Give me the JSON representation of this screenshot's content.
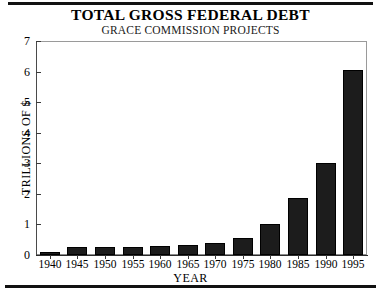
{
  "header": {
    "title": "TOTAL GROSS FEDERAL DEBT",
    "subtitle": "GRACE COMMISSION PROJECTS"
  },
  "chart_data": {
    "type": "bar",
    "title": "TOTAL GROSS FEDERAL DEBT",
    "subtitle": "GRACE COMMISSION PROJECTS",
    "xlabel": "YEAR",
    "ylabel": "TRILLIONS OF $",
    "categories": [
      "1940",
      "1945",
      "1950",
      "1955",
      "1960",
      "1965",
      "1970",
      "1975",
      "1980",
      "1985",
      "1990",
      "1995"
    ],
    "values": [
      0.05,
      0.26,
      0.26,
      0.27,
      0.29,
      0.32,
      0.38,
      0.54,
      1.0,
      1.85,
      3.0,
      6.05
    ],
    "ylim": [
      0,
      7
    ],
    "ytick_labels": [
      "0",
      "1",
      "2",
      "3",
      "4",
      "5",
      "6",
      "7"
    ],
    "ytick_values": [
      0,
      1,
      2,
      3,
      4,
      5,
      6,
      7
    ],
    "grid": false,
    "legend": "none",
    "bar_color": "#1c1c1c",
    "axis_color": "#2b2b2b",
    "background": "#ffffff"
  }
}
